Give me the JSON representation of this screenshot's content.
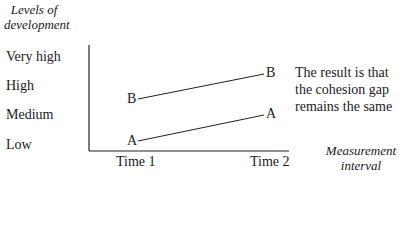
{
  "y_axis": {
    "title_line1": "Levels of",
    "title_line2": "development",
    "ticks": [
      "Very high",
      "High",
      "Medium",
      "Low"
    ]
  },
  "x_axis": {
    "title_line1": "Measurement",
    "title_line2": "interval",
    "ticks": [
      "Time 1",
      "Time 2"
    ]
  },
  "series": [
    {
      "name": "B",
      "start_label": "B",
      "end_label": "B",
      "start": "Medium-High",
      "end": "High-Very high"
    },
    {
      "name": "A",
      "start_label": "A",
      "end_label": "A",
      "start": "Low",
      "end": "Medium"
    }
  ],
  "note": {
    "line1": "The result is that",
    "line2": "the cohesion gap",
    "line3": "remains the same"
  }
}
